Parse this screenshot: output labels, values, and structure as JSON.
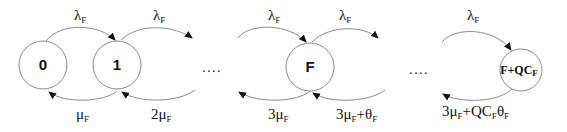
{
  "diagram": {
    "type": "state-transition (birth-death Markov chain)",
    "states": [
      {
        "id": "s0",
        "label": "0"
      },
      {
        "id": "s1",
        "label": "1"
      },
      {
        "id": "sF",
        "label": "F"
      },
      {
        "id": "sFQ",
        "label": "F+QC",
        "label_sub": "F"
      }
    ],
    "ellipses": [
      {
        "id": "gap1",
        "text": "...."
      },
      {
        "id": "gap2",
        "text": "...."
      }
    ],
    "forward_rates": [
      {
        "from": "0",
        "to": "1",
        "main": "λ",
        "sub": "F"
      },
      {
        "from": "1",
        "to": "2",
        "main": "λ",
        "sub": "F"
      },
      {
        "from": "F-1",
        "to": "F",
        "main": "λ",
        "sub": "F"
      },
      {
        "from": "F",
        "to": "F+1",
        "main": "λ",
        "sub": "F"
      },
      {
        "from": "F+QC_F-1",
        "to": "F+QC_F",
        "main": "λ",
        "sub": "F"
      }
    ],
    "backward_rates": [
      {
        "from": "1",
        "to": "0",
        "parts": [
          {
            "t": "μ"
          },
          {
            "t": "F",
            "sub": true
          }
        ]
      },
      {
        "from": "2",
        "to": "1",
        "parts": [
          {
            "t": "2μ"
          },
          {
            "t": "F",
            "sub": true
          }
        ]
      },
      {
        "from": "F",
        "to": "F-1",
        "parts": [
          {
            "t": "3μ"
          },
          {
            "t": "F",
            "sub": true
          }
        ]
      },
      {
        "from": "F+1",
        "to": "F",
        "parts": [
          {
            "t": "3μ"
          },
          {
            "t": "F",
            "sub": true
          },
          {
            "t": "+θ"
          },
          {
            "t": "F",
            "sub": true
          }
        ]
      },
      {
        "from": "F+QC_F",
        "to": "F+QC_F-1",
        "parts": [
          {
            "t": "3μ"
          },
          {
            "t": "F",
            "sub": true
          },
          {
            "t": "+QC"
          },
          {
            "t": "F",
            "sub": true
          },
          {
            "t": "θ"
          },
          {
            "t": "F",
            "sub": true
          }
        ]
      }
    ],
    "colors": {
      "stroke": "#8a8a8a",
      "text": "#111111",
      "background": "#ffffff"
    }
  }
}
